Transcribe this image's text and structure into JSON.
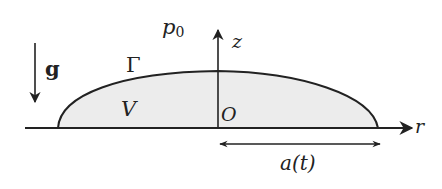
{
  "diagram": {
    "type": "thin-film-drop-schematic",
    "labels": {
      "pressure": "p",
      "pressure_sub": "0",
      "gravity": "g",
      "interface": "Γ",
      "volume": "V",
      "origin": "O",
      "z_axis": "z",
      "r_axis": "r",
      "radius": "a(t)"
    },
    "colors": {
      "stroke": "#222222",
      "fill": "#ececec",
      "background": "#ffffff"
    }
  }
}
